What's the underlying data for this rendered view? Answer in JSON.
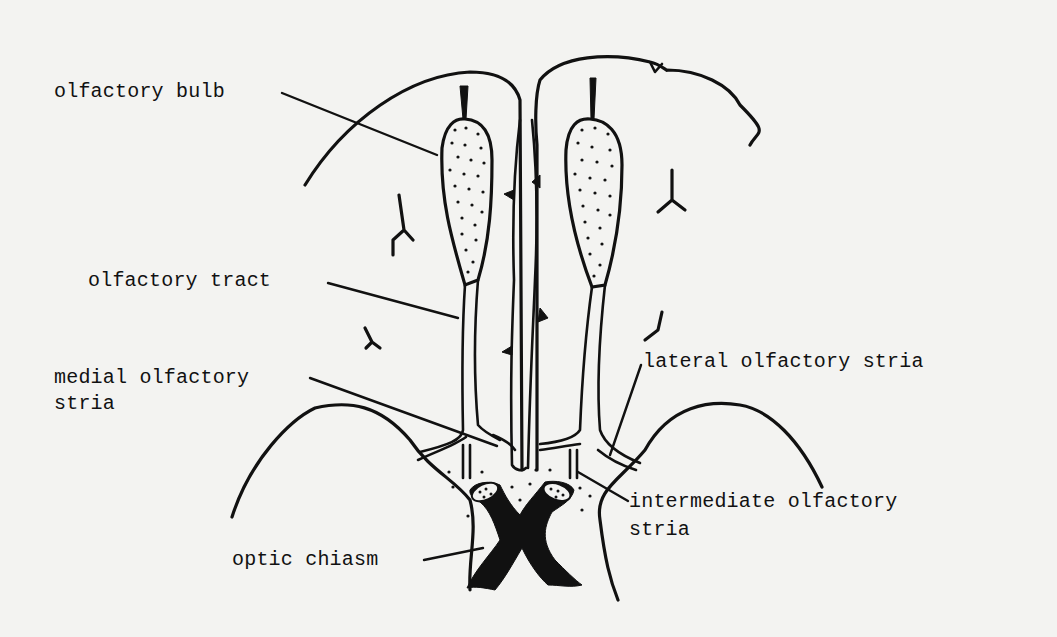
{
  "figure": {
    "labels": {
      "olfactory_bulb": "olfactory bulb",
      "olfactory_tract": "olfactory tract",
      "medial_olfactory_stria_line1": "medial olfactory",
      "medial_olfactory_stria_line2": "stria",
      "lateral_olfactory_stria": "lateral olfactory stria",
      "intermediate_olfactory_stria_line1": "intermediate olfactory",
      "intermediate_olfactory_stria_line2": "stria",
      "optic_chiasm": "optic chiasm"
    },
    "colors": {
      "ink": "#111111",
      "paper": "#f3f3f1"
    }
  }
}
